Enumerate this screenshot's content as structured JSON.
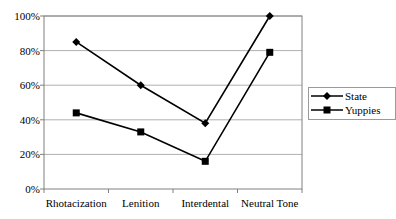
{
  "chart_data": {
    "type": "line",
    "title": "",
    "xlabel": "",
    "ylabel": "",
    "categories": [
      "Rhotacization",
      "Lenition",
      "Interdental",
      "Neutral Tone"
    ],
    "series": [
      {
        "name": "State",
        "marker": "diamond",
        "values": [
          85,
          60,
          38,
          100
        ]
      },
      {
        "name": "Yuppies",
        "marker": "square",
        "values": [
          44,
          33,
          16,
          79
        ]
      }
    ],
    "ylim": [
      0,
      100
    ],
    "yticks": [
      "0%",
      "20%",
      "40%",
      "60%",
      "80%",
      "100%"
    ],
    "grid": true,
    "legend_position": "right"
  },
  "legend": {
    "items": [
      "State",
      "Yuppies"
    ]
  },
  "colors": {
    "line": "#000000",
    "grid": "#b0b0b0",
    "axis": "#808080"
  }
}
